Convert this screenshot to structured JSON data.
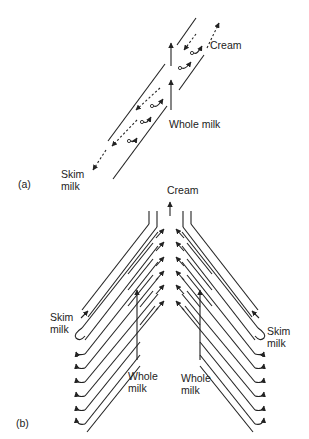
{
  "figure": {
    "panel_a": {
      "tag": "(a)",
      "labels": {
        "cream": "Cream",
        "whole_milk": "Whole milk",
        "skim_milk_line1": "Skim",
        "skim_milk_line2": "milk"
      }
    },
    "panel_b": {
      "tag": "(b)",
      "labels": {
        "cream": "Cream",
        "skim_left_line1": "Skim",
        "skim_left_line2": "milk",
        "skim_right_line1": "Skim",
        "skim_right_line2": "milk",
        "whole_left_line1": "Whole",
        "whole_left_line2": "milk",
        "whole_right_line1": "Whole",
        "whole_right_line2": "milk"
      }
    },
    "colors": {
      "ink": "#222222",
      "background": "#ffffff"
    }
  }
}
